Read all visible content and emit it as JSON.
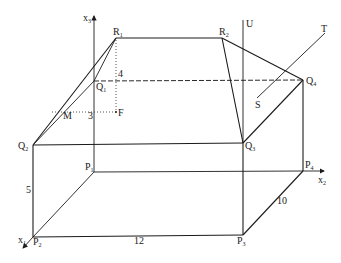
{
  "diagram": {
    "type": "3d-geometry",
    "axes": {
      "x1": {
        "label": "x",
        "sub": "1"
      },
      "x2": {
        "label": "x",
        "sub": "2"
      },
      "x3": {
        "label": "x",
        "sub": "3"
      }
    },
    "points": {
      "P1": {
        "label": "P",
        "sub": "1"
      },
      "P2": {
        "label": "P",
        "sub": "2"
      },
      "P3": {
        "label": "P",
        "sub": "3"
      },
      "P4": {
        "label": "P",
        "sub": "4"
      },
      "Q1": {
        "label": "Q",
        "sub": "1"
      },
      "Q2": {
        "label": "Q",
        "sub": "2"
      },
      "Q3": {
        "label": "Q",
        "sub": "3"
      },
      "Q4": {
        "label": "Q",
        "sub": "4"
      },
      "R1": {
        "label": "R",
        "sub": "1"
      },
      "R2": {
        "label": "R",
        "sub": "2"
      },
      "M": {
        "label": "M"
      },
      "F": {
        "label": "F"
      },
      "S": {
        "label": "S"
      },
      "T": {
        "label": "T"
      },
      "U": {
        "label": "U"
      }
    },
    "dimensions": {
      "height_P2Q2": "5",
      "length_P2P3": "12",
      "depth_P3P4": "10",
      "vertical_FR1": "4",
      "horizontal_MF": "3"
    },
    "colors": {
      "line": "#1c1c1c",
      "background": "#ffffff"
    }
  }
}
